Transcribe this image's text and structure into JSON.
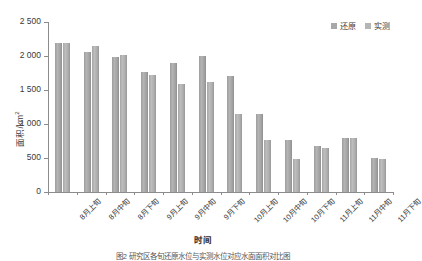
{
  "chart_data": {
    "type": "bar",
    "title": "",
    "xlabel": "时间",
    "ylabel": "面积/km",
    "ylabel_sup": "2",
    "ylabel_full": "面积/km²",
    "ylim": [
      0,
      2500
    ],
    "yticks": [
      0,
      500,
      1000,
      1500,
      2000,
      2500
    ],
    "ytick_labels": [
      "0",
      "500",
      "1 000",
      "1 500",
      "2 000",
      "2 500"
    ],
    "grid": false,
    "legend_position": "top-right",
    "categories": [
      "8月上旬",
      "8月中旬",
      "8月下旬",
      "9月上旬",
      "9月中旬",
      "9月下旬",
      "10月上旬",
      "10月中旬",
      "10月下旬",
      "11月上旬",
      "11月中旬",
      "11月下旬"
    ],
    "series": [
      {
        "name": "还原",
        "color": "#a8a8a8",
        "values": [
          2190,
          2060,
          1990,
          1770,
          1890,
          2000,
          1700,
          1140,
          760,
          680,
          800,
          500
        ]
      },
      {
        "name": "实测",
        "color": "#b5b5b5",
        "values": [
          2190,
          2140,
          2010,
          1720,
          1590,
          1620,
          1150,
          770,
          480,
          650,
          790,
          490
        ]
      }
    ]
  },
  "legend": {
    "items": [
      {
        "label": "还原",
        "color": "#a8a8a8"
      },
      {
        "label": "实测",
        "color": "#b5b5b5"
      }
    ]
  },
  "caption": {
    "text": "图2  研究区各旬还原水位与实测水位对应水面面积对比图"
  }
}
